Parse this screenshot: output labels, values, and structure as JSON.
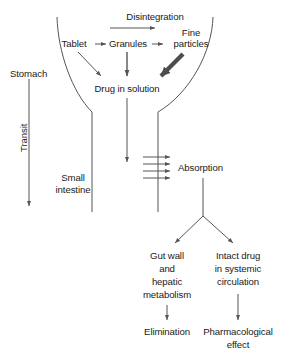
{
  "figure": {
    "type": "flow-diagram",
    "line_color": "#555555",
    "bold_arrow_color": "#4d4d4d",
    "text_color": "#1a1a1a",
    "background": "#ffffff",
    "width": 290,
    "height": 358
  },
  "labels": {
    "disintegration": "Disintegration",
    "tablet": "Tablet",
    "granules": "Granules",
    "fine_particles_line1": "Fine",
    "fine_particles_line2": "particles",
    "stomach": "Stomach",
    "drug_in_solution": "Drug in solution",
    "transit": "Transit",
    "small_intestine_line1": "Small",
    "small_intestine_line2": "intestine",
    "absorption": "Absorption",
    "gut_wall_line1": "Gut wall",
    "gut_wall_line2": "and",
    "gut_wall_line3": "hepatic",
    "gut_wall_line4": "metabolism",
    "intact_drug_line1": "Intact drug",
    "intact_drug_line2": "in systemic",
    "intact_drug_line3": "circulation",
    "elimination": "Elimination",
    "pharmacological_line1": "Pharmacological",
    "pharmacological_line2": "effect"
  },
  "flow": {
    "nodes": [
      "Tablet",
      "Granules",
      "Fine particles",
      "Drug in solution",
      "Absorption",
      "Gut wall and hepatic metabolism",
      "Intact drug in systemic circulation",
      "Elimination",
      "Pharmacological effect"
    ],
    "edges": [
      {
        "from": "Tablet",
        "to": "Granules",
        "label": "Disintegration"
      },
      {
        "from": "Granules",
        "to": "Fine particles",
        "label": "Disintegration"
      },
      {
        "from": "Tablet",
        "to": "Drug in solution",
        "label": ""
      },
      {
        "from": "Granules",
        "to": "Drug in solution",
        "label": ""
      },
      {
        "from": "Fine particles",
        "to": "Drug in solution",
        "label": "",
        "emphasis": "bold"
      },
      {
        "from": "Drug in solution",
        "to": "Absorption",
        "label": ""
      },
      {
        "from": "Absorption",
        "to": "Gut wall and hepatic metabolism",
        "label": ""
      },
      {
        "from": "Absorption",
        "to": "Intact drug in systemic circulation",
        "label": ""
      },
      {
        "from": "Gut wall and hepatic metabolism",
        "to": "Elimination",
        "label": ""
      },
      {
        "from": "Intact drug in systemic circulation",
        "to": "Pharmacological effect",
        "label": ""
      }
    ],
    "regions": [
      "Stomach",
      "Small intestine"
    ],
    "axis": "Transit"
  }
}
